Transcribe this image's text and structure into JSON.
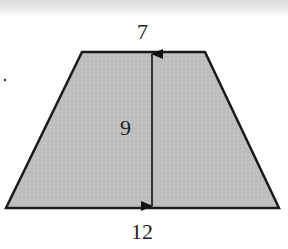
{
  "figure": {
    "shape": "trapezoid",
    "fill_color": "#bdbdbd",
    "stroke_color": "#1a1a1a",
    "labels": {
      "top_base": "7",
      "height": "9",
      "bottom_base": "12"
    },
    "side_marker": "."
  }
}
